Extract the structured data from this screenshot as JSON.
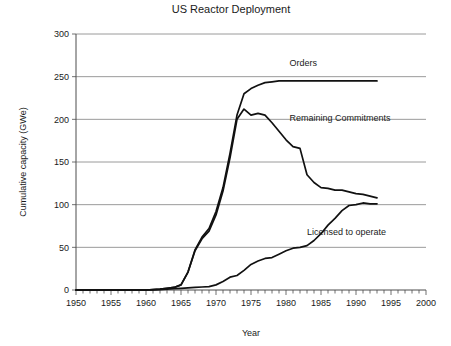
{
  "chart_data": {
    "type": "line",
    "title": "US Reactor Deployment",
    "xlabel": "Year",
    "ylabel": "Cumulative capacity (GWe)",
    "xlim": [
      1950,
      2000
    ],
    "ylim": [
      0,
      300
    ],
    "x_tick_labels": [
      "1950",
      "1955",
      "1960",
      "1965",
      "1970",
      "1975",
      "1980",
      "1985",
      "1990",
      "1995",
      "2000"
    ],
    "x_tick_values": [
      1950,
      1955,
      1960,
      1965,
      1970,
      1975,
      1980,
      1985,
      1990,
      1995,
      2000
    ],
    "x_minor_tick_interval": 1,
    "y_tick_labels": [
      "0",
      "50",
      "100",
      "150",
      "200",
      "250",
      "300"
    ],
    "y_tick_values": [
      0,
      50,
      100,
      150,
      200,
      250,
      300
    ],
    "grid": "horizontal",
    "legend_position": "inline-annotations",
    "series": [
      {
        "name": "Orders",
        "annotation": "Orders",
        "annotation_xy": [
          1980.5,
          262
        ],
        "color": "#111111",
        "x": [
          1950,
          1955,
          1960,
          1961,
          1962,
          1963,
          1964,
          1965,
          1966,
          1967,
          1968,
          1969,
          1970,
          1971,
          1972,
          1973,
          1974,
          1975,
          1976,
          1977,
          1978,
          1979,
          1980,
          1985,
          1990,
          1993
        ],
        "values": [
          0,
          0,
          0,
          0.5,
          1,
          2,
          3,
          6,
          21,
          47,
          62,
          72,
          92,
          120,
          160,
          205,
          230,
          236,
          240,
          243,
          244,
          245,
          245,
          245,
          245,
          245
        ]
      },
      {
        "name": "Remaining Commitments",
        "annotation": "Remaining Commitments",
        "annotation_xy": [
          1980.5,
          198
        ],
        "color": "#111111",
        "x": [
          1950,
          1960,
          1962,
          1963,
          1964,
          1965,
          1966,
          1967,
          1968,
          1969,
          1970,
          1971,
          1972,
          1973,
          1974,
          1975,
          1976,
          1977,
          1978,
          1979,
          1980,
          1981,
          1982,
          1983,
          1984,
          1985,
          1986,
          1987,
          1988,
          1989,
          1990,
          1991,
          1992,
          1993
        ],
        "values": [
          0,
          0,
          1,
          2,
          3,
          6,
          21,
          46,
          60,
          69,
          88,
          116,
          155,
          200,
          212,
          205,
          207,
          205,
          196,
          186,
          176,
          168,
          166,
          135,
          126,
          120,
          119,
          117,
          117,
          115,
          113,
          112,
          110,
          108
        ]
      },
      {
        "name": "Licensed to operate",
        "annotation": "Licensed to operate",
        "annotation_xy": [
          1983.0,
          64
        ],
        "color": "#111111",
        "x": [
          1950,
          1960,
          1962,
          1963,
          1964,
          1965,
          1966,
          1967,
          1968,
          1969,
          1970,
          1971,
          1972,
          1973,
          1974,
          1975,
          1976,
          1977,
          1978,
          1979,
          1980,
          1981,
          1982,
          1983,
          1984,
          1985,
          1986,
          1987,
          1988,
          1989,
          1990,
          1991,
          1992,
          1993
        ],
        "values": [
          0,
          0,
          0.5,
          1,
          1.5,
          2,
          2.5,
          3,
          3.5,
          4,
          6,
          10,
          15,
          17,
          23,
          30,
          34,
          37,
          38,
          42,
          46,
          49,
          50,
          52,
          58,
          66,
          76,
          84,
          93,
          99,
          100,
          102,
          101,
          101
        ]
      }
    ]
  }
}
